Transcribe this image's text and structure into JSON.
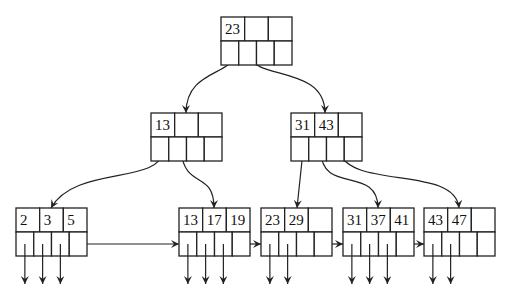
{
  "colors": {
    "stroke": "#222222",
    "text": "#111111",
    "background": "#ffffff"
  },
  "layout": {
    "key_cells": 3,
    "pointer_cells": 4,
    "node_width": 71,
    "row_height": 24
  },
  "nodes": [
    {
      "id": "root",
      "level": 0,
      "x": 221,
      "y": 17,
      "keys": [
        "23",
        "",
        ""
      ]
    },
    {
      "id": "internal-left",
      "level": 1,
      "x": 151,
      "y": 113,
      "keys": [
        "13",
        "",
        ""
      ]
    },
    {
      "id": "internal-right",
      "level": 1,
      "x": 291,
      "y": 113,
      "keys": [
        "31",
        "43",
        ""
      ]
    },
    {
      "id": "leaf-1",
      "level": 2,
      "x": 16,
      "y": 208,
      "keys": [
        "2",
        "3",
        "5"
      ],
      "data_pointers": 3
    },
    {
      "id": "leaf-2",
      "level": 2,
      "x": 179,
      "y": 208,
      "keys": [
        "13",
        "17",
        "19"
      ],
      "data_pointers": 3
    },
    {
      "id": "leaf-3",
      "level": 2,
      "x": 261,
      "y": 208,
      "keys": [
        "23",
        "29",
        ""
      ],
      "data_pointers": 2
    },
    {
      "id": "leaf-4",
      "level": 2,
      "x": 343,
      "y": 208,
      "keys": [
        "31",
        "37",
        "41"
      ],
      "data_pointers": 3
    },
    {
      "id": "leaf-5",
      "level": 2,
      "x": 424,
      "y": 208,
      "keys": [
        "43",
        "47",
        ""
      ],
      "data_pointers": 2
    }
  ],
  "edges": [
    {
      "from": "root",
      "to": "internal-left",
      "path": "M233,55 C233,75 186,70 186,113"
    },
    {
      "from": "root",
      "to": "internal-right",
      "path": "M251,55 C251,80 325,65 325,113"
    },
    {
      "from": "internal-left",
      "to": "leaf-1",
      "path": "M163,151 C160,185 75,165 51,208"
    },
    {
      "from": "internal-left",
      "to": "leaf-2",
      "path": "M181,151 C185,190 214,170 214,208"
    },
    {
      "from": "internal-right",
      "to": "leaf-3",
      "path": "M303,151 L297,208"
    },
    {
      "from": "internal-right",
      "to": "leaf-4",
      "path": "M321,151 C321,195 378,165 378,208"
    },
    {
      "from": "internal-right",
      "to": "leaf-5",
      "path": "M339,151 C350,190 455,165 459,208"
    }
  ],
  "sibling_links": [
    {
      "from": "leaf-1",
      "to": "leaf-2",
      "path": "M81,244 L179,244"
    },
    {
      "from": "leaf-2",
      "to": "leaf-3",
      "path": "M241,244 L261,244"
    },
    {
      "from": "leaf-3",
      "to": "leaf-4",
      "path": "M323,244 L343,244"
    },
    {
      "from": "leaf-4",
      "to": "leaf-5",
      "path": "M404,244 L424,244"
    }
  ]
}
